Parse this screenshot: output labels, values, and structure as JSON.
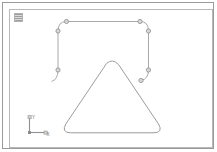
{
  "window": {
    "title": "Viewport"
  },
  "viewport": {
    "label_icon": "viewport-config-icon",
    "background_color": "#ffffff",
    "border_color": "#b8b8b8",
    "outer_border_color": "#9a9a9a"
  },
  "axis_gizmo": {
    "name": "world-axis-tripod",
    "y_label": "Y",
    "x_label": "X",
    "axis_color": "#8f8f8f"
  },
  "shapes": [
    {
      "name": "rounded-rectangle-spline",
      "type": "open-spline",
      "stroke_color": "#a9a9a9",
      "selected": true,
      "vertex_count": 8,
      "path": "M 56.5 11.0 L 130.0 11.0 Q 138.5 11.0 138.5 20.0 L 138.5 60.5 Q 138.5 69.5 130.5 70.5",
      "left_path": "M 56.5 11.0 Q 48.0 11.0 48.0 20.0 L 48.0 60.0 Q 48.0 69.5 41.5 71.5",
      "vertices": [
        {
          "cx": 56.5,
          "cy": 11.0
        },
        {
          "cx": 130.0,
          "cy": 11.0
        },
        {
          "cx": 48.0,
          "cy": 21.0
        },
        {
          "cx": 138.5,
          "cy": 21.0
        },
        {
          "cx": 48.0,
          "cy": 60.0
        },
        {
          "cx": 138.5,
          "cy": 60.0
        },
        {
          "cx": 130.5,
          "cy": 70.5
        }
      ]
    },
    {
      "name": "rounded-triangle-spline",
      "type": "closed-spline",
      "stroke_color": "#9c9c9c",
      "selected": false,
      "path": "M 97.0 53.0 Q 102.5 48.5 108.0 54.5 L 148.0 114.5 Q 153.0 122.5 144.0 123.0 L 60.5 123.0 Q 51.0 122.5 56.0 114.5 Z"
    }
  ],
  "colors": {
    "spline": "#a9a9a9",
    "vertex_fill": "#d9d9d9",
    "vertex_stroke": "#8a8a8a",
    "background": "#ffffff"
  }
}
